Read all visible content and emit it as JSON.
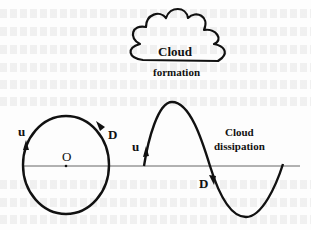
{
  "diagram": {
    "cloud": {
      "label_line1": "Cloud",
      "label_line2": "formation"
    },
    "circle": {
      "center_label": "O",
      "up_label": "u",
      "down_label": "D"
    },
    "wave": {
      "up_label": "u",
      "down_label": "D",
      "label_line1": "Cloud",
      "label_line2": "dissipation"
    },
    "colors": {
      "stroke": "#111111",
      "baseline": "#666666",
      "background": "#fdfdfd"
    }
  }
}
